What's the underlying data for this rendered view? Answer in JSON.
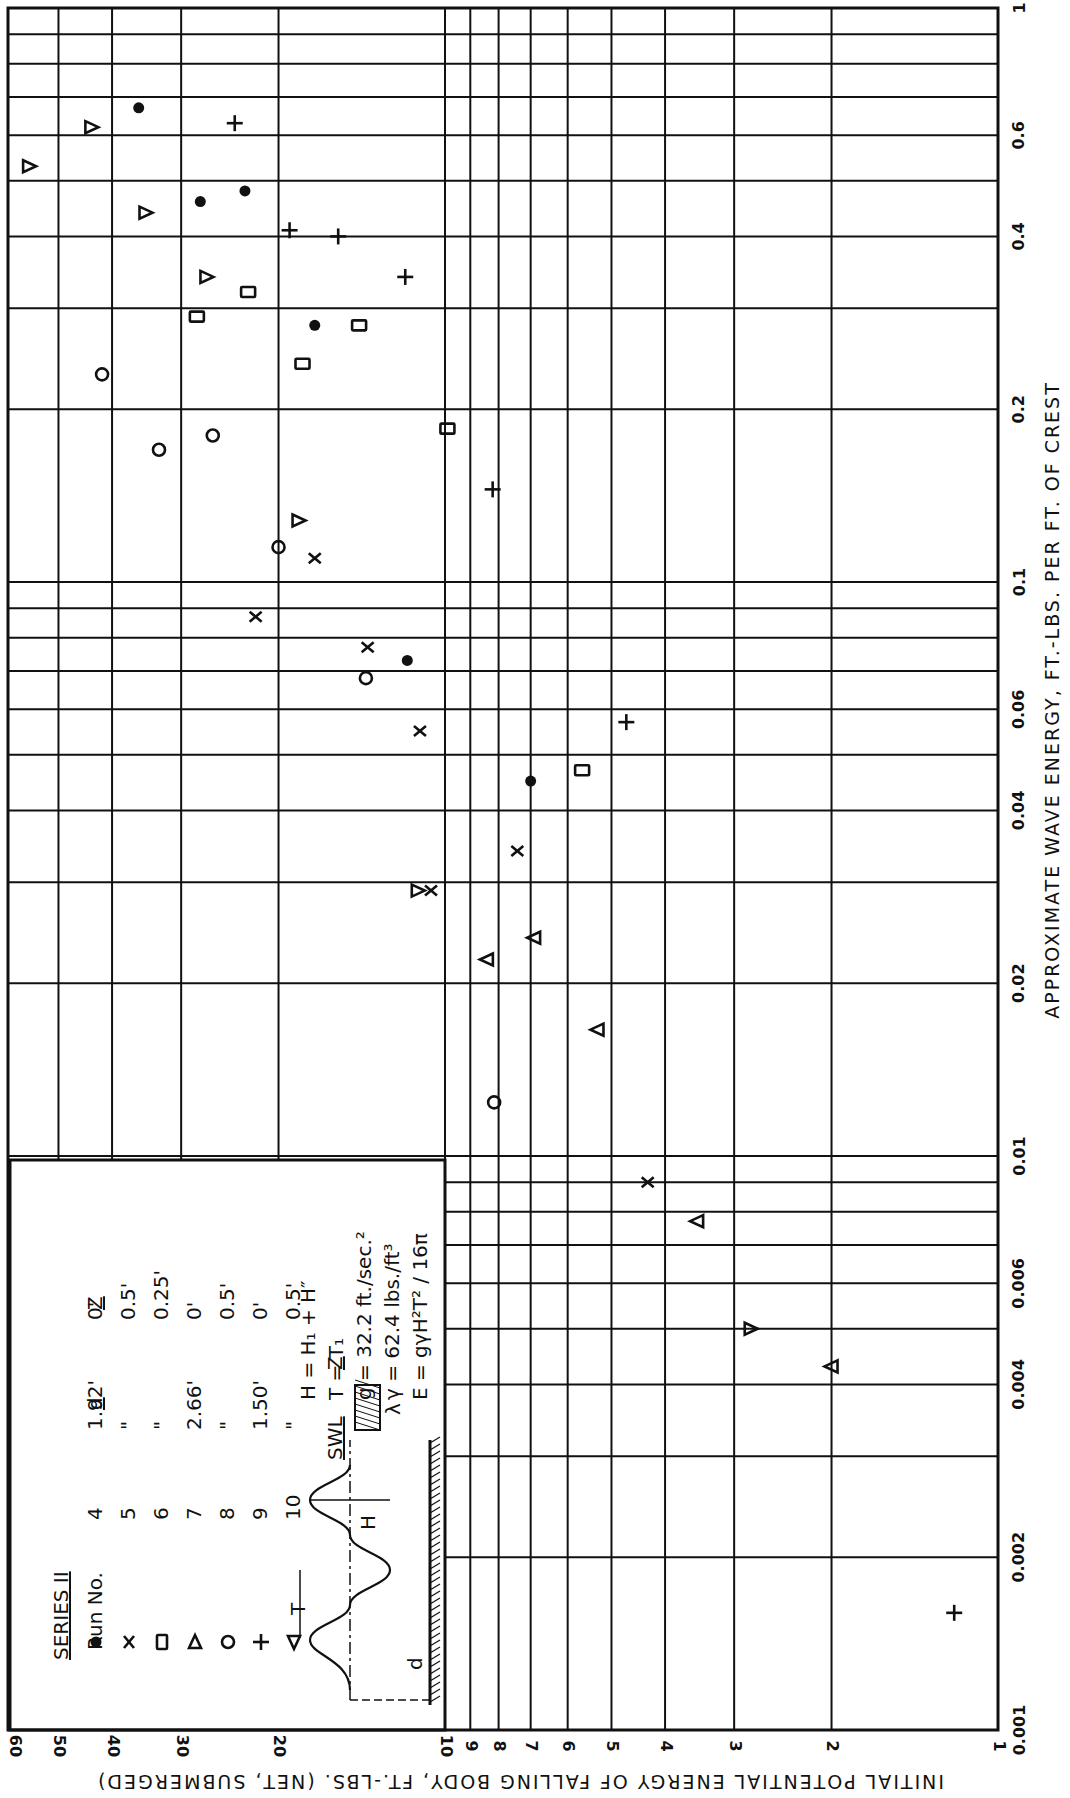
{
  "chart_data": {
    "type": "scatter",
    "title": "",
    "xlabel": "APPROXIMATE WAVE ENERGY, FT.-LBS. PER FT. OF CREST",
    "ylabel": "INITIAL POTENTIAL ENERGY OF FALLING BODY, FT.-LBS. (NET, SUBMERGED)",
    "xscale": "log",
    "yscale": "log",
    "xlim": [
      0.001,
      1
    ],
    "ylim": [
      1,
      60
    ],
    "grid": true,
    "orientation_note_visible": "figure rotated 90 degrees",
    "x_ticks": [
      "0.001",
      "0.002",
      "0.004",
      "0.006",
      "0.01",
      "0.02",
      "0.04",
      "0.06",
      "0.1",
      "0.2",
      "0.4",
      "0.6",
      "1"
    ],
    "y_ticks": [
      "1",
      "2",
      "3",
      "4",
      "5",
      "6",
      "7",
      "8",
      "9",
      "10",
      "20",
      "30",
      "40",
      "50",
      "60"
    ],
    "legend": {
      "title": "SERIES II",
      "columns": [
        "Run No.",
        "d",
        "Z"
      ],
      "entries": [
        {
          "marker": "dot",
          "run": "4",
          "d": "1.92'",
          "z": "0'"
        },
        {
          "marker": "x",
          "run": "5",
          "d": "\"",
          "z": "0.5'"
        },
        {
          "marker": "square",
          "run": "6",
          "d": "\"",
          "z": "0.25'"
        },
        {
          "marker": "tri-right",
          "run": "7",
          "d": "2.66'",
          "z": "0'"
        },
        {
          "marker": "circle",
          "run": "8",
          "d": "\"",
          "z": "0.5'"
        },
        {
          "marker": "plus",
          "run": "9",
          "d": "1.50'",
          "z": "0'"
        },
        {
          "marker": "tri-left",
          "run": "10",
          "d": "\"",
          "z": "0.5'"
        }
      ]
    },
    "formulas": [
      "H = H₁ + H″",
      "T = T₁",
      "g = 32.2 ft./sec.²",
      "γ = 62.4 lbs./ft³",
      "E = gγH²T² / 16π"
    ],
    "series": [
      {
        "name": "Run No. 4",
        "marker": "dot",
        "points": [
          {
            "x": 0.67,
            "y": 35.8
          },
          {
            "x": 0.48,
            "y": 23
          },
          {
            "x": 0.46,
            "y": 27.7
          },
          {
            "x": 0.28,
            "y": 17.2
          },
          {
            "x": 0.073,
            "y": 11.7
          },
          {
            "x": 0.045,
            "y": 7.0
          }
        ]
      },
      {
        "name": "Run No. 5",
        "marker": "x",
        "points": [
          {
            "x": 0.11,
            "y": 17.2
          },
          {
            "x": 0.087,
            "y": 22.0
          },
          {
            "x": 0.077,
            "y": 13.8
          },
          {
            "x": 0.055,
            "y": 11.1
          },
          {
            "x": 0.034,
            "y": 7.4
          },
          {
            "x": 0.029,
            "y": 10.6
          },
          {
            "x": 0.009,
            "y": 4.3
          }
        ]
      },
      {
        "name": "Run No. 6",
        "marker": "square",
        "points": [
          {
            "x": 0.32,
            "y": 22.7
          },
          {
            "x": 0.29,
            "y": 28.1
          },
          {
            "x": 0.28,
            "y": 14.3
          },
          {
            "x": 0.24,
            "y": 18.1
          },
          {
            "x": 0.185,
            "y": 9.9
          },
          {
            "x": 0.047,
            "y": 5.65
          }
        ]
      },
      {
        "name": "Run No. 7",
        "marker": "tri-right",
        "points": [
          {
            "x": 0.62,
            "y": 43.6
          },
          {
            "x": 0.53,
            "y": 56.5
          },
          {
            "x": 0.44,
            "y": 34.8
          },
          {
            "x": 0.34,
            "y": 27
          },
          {
            "x": 0.128,
            "y": 18.4
          },
          {
            "x": 0.029,
            "y": 11.2
          },
          {
            "x": 0.005,
            "y": 2.8
          }
        ]
      },
      {
        "name": "Run No. 8",
        "marker": "circle",
        "points": [
          {
            "x": 0.23,
            "y": 41.7
          },
          {
            "x": 0.18,
            "y": 26.3
          },
          {
            "x": 0.17,
            "y": 32.9
          },
          {
            "x": 0.115,
            "y": 20.0
          },
          {
            "x": 0.068,
            "y": 13.9
          },
          {
            "x": 0.0124,
            "y": 8.15
          }
        ]
      },
      {
        "name": "Run No. 9",
        "marker": "plus",
        "points": [
          {
            "x": 0.63,
            "y": 24
          },
          {
            "x": 0.41,
            "y": 19.1
          },
          {
            "x": 0.4,
            "y": 15.6
          },
          {
            "x": 0.34,
            "y": 11.8
          },
          {
            "x": 0.145,
            "y": 8.2
          },
          {
            "x": 0.057,
            "y": 4.7
          },
          {
            "x": 0.0016,
            "y": 1.2
          }
        ]
      },
      {
        "name": "Run No. 10",
        "marker": "tri-left",
        "points": [
          {
            "x": 0.024,
            "y": 6.9
          },
          {
            "x": 0.022,
            "y": 8.4
          },
          {
            "x": 0.0166,
            "y": 5.3
          },
          {
            "x": 0.0077,
            "y": 3.5
          },
          {
            "x": 0.0043,
            "y": 2.0
          }
        ]
      }
    ]
  },
  "legend_box": {
    "series_title": "SERIES II",
    "run_header": "Run No.",
    "d_header": "d",
    "z_header": "Z",
    "swl_label": "SWL",
    "diagram_labels": {
      "T": "T",
      "H": "H",
      "d": "d",
      "Z": "Z",
      "lambda": "λ"
    }
  }
}
